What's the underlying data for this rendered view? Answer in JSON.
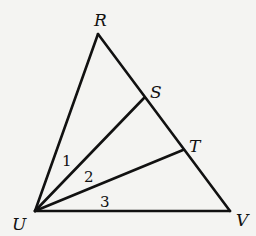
{
  "diagram": {
    "type": "geometry-triangle",
    "vertices": {
      "R": {
        "label": "R",
        "x": 98,
        "y": 34
      },
      "S": {
        "label": "S",
        "x": 144,
        "y": 98
      },
      "T": {
        "label": "T",
        "x": 183,
        "y": 150
      },
      "U": {
        "label": "U",
        "x": 35,
        "y": 211
      },
      "V": {
        "label": "V",
        "x": 230,
        "y": 211
      }
    },
    "segments": [
      [
        "U",
        "R"
      ],
      [
        "R",
        "V"
      ],
      [
        "U",
        "V"
      ],
      [
        "U",
        "S"
      ],
      [
        "U",
        "T"
      ]
    ],
    "angles": [
      {
        "label": "1",
        "between": [
          "UR",
          "US"
        ]
      },
      {
        "label": "2",
        "between": [
          "US",
          "UT"
        ]
      },
      {
        "label": "3",
        "between": [
          "UT",
          "UV"
        ]
      }
    ],
    "line_color": "#111111",
    "background": "#f4f4f2"
  }
}
